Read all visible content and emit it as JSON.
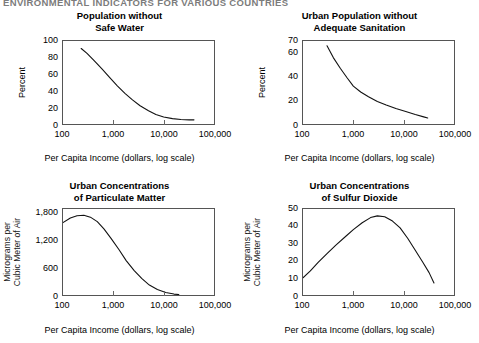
{
  "page_header": "ENVIRONMENTAL INDICATORS FOR VARIOUS COUNTRIES",
  "shared": {
    "xlabel": "Per Capita Income (dollars, log scale)",
    "xticks": [
      "100",
      "1,000",
      "10,000",
      "100,000"
    ]
  },
  "chart_data": [
    {
      "id": "population-without-safe-water",
      "type": "line",
      "title_line1": "Population without",
      "title_line2": "Safe Water",
      "xlabel": "Per Capita Income (dollars, log scale)",
      "ylabel": "Percent",
      "ylabel_line1": "Percent",
      "ylabel_line2": "",
      "xscale": "log",
      "xlim": [
        100,
        100000
      ],
      "xticks": [
        "100",
        "1,000",
        "10,000",
        "100,000"
      ],
      "xtickvalues": [
        100,
        1000,
        10000,
        100000
      ],
      "ylim": [
        0,
        100
      ],
      "yticks": [
        "0",
        "20",
        "40",
        "60",
        "80",
        "100"
      ],
      "ytickvalues": [
        0,
        20,
        40,
        60,
        80,
        100
      ],
      "grid": false,
      "legend": "none",
      "x": [
        230,
        300,
        420,
        600,
        850,
        1200,
        1700,
        2400,
        3400,
        5000,
        7000,
        10000,
        15000,
        22000,
        32000,
        40000
      ],
      "y": [
        91,
        85,
        76,
        66,
        56,
        46,
        37,
        29,
        22,
        16,
        11.5,
        8.5,
        6.5,
        5.5,
        5,
        5
      ]
    },
    {
      "id": "urban-population-without-adequate-sanitation",
      "type": "line",
      "title_line1": "Urban Population without",
      "title_line2": "Adequate Sanitation",
      "xlabel": "Per Capita Income (dollars, log scale)",
      "ylabel": "Percent",
      "ylabel_line1": "Percent",
      "ylabel_line2": "",
      "xscale": "log",
      "xlim": [
        100,
        100000
      ],
      "xticks": [
        "100",
        "1,000",
        "10,000",
        "100,000"
      ],
      "xtickvalues": [
        100,
        1000,
        10000,
        100000
      ],
      "ylim": [
        0,
        70
      ],
      "yticks": [
        "0",
        "20",
        "40",
        "60",
        "70"
      ],
      "ytickvalues": [
        0,
        20,
        40,
        60,
        70
      ],
      "grid": false,
      "legend": "none",
      "x": [
        300,
        400,
        550,
        750,
        1000,
        1400,
        2000,
        3000,
        4500,
        7000,
        11000,
        17000,
        25000,
        30000
      ],
      "y": [
        66,
        56,
        47,
        39,
        32,
        27,
        23,
        19,
        16,
        13,
        10.5,
        8,
        6,
        5
      ]
    },
    {
      "id": "urban-concentrations-of-particulate-matter",
      "type": "line",
      "title_line1": "Urban Concentrations",
      "title_line2": "of Particulate Matter",
      "xlabel": "Per Capita Income (dollars, log scale)",
      "ylabel": "Micrograms per Cubic Meter of Air",
      "ylabel_line1": "Micrograms per",
      "ylabel_line2": "Cubic Meter of Air",
      "xscale": "log",
      "xlim": [
        100,
        100000
      ],
      "xticks": [
        "100",
        "1,000",
        "10,000",
        "100,000"
      ],
      "xtickvalues": [
        100,
        1000,
        10000,
        100000
      ],
      "ylim": [
        0,
        1900
      ],
      "yticks": [
        "0",
        "600",
        "1,200",
        "1,800"
      ],
      "ytickvalues": [
        0,
        600,
        1200,
        1800
      ],
      "grid": false,
      "legend": "none",
      "x": [
        100,
        140,
        190,
        260,
        350,
        480,
        650,
        900,
        1300,
        1800,
        2600,
        3700,
        5200,
        7500,
        11000,
        16000,
        20000
      ],
      "y": [
        1600,
        1700,
        1750,
        1760,
        1720,
        1620,
        1460,
        1250,
        1000,
        760,
        540,
        360,
        220,
        120,
        55,
        20,
        10
      ]
    },
    {
      "id": "urban-concentrations-of-sulfur-dioxide",
      "type": "line",
      "title_line1": "Urban Concentrations",
      "title_line2": "of Sulfur Dioxide",
      "xlabel": "Per Capita Income (dollars, log scale)",
      "ylabel": "Micrograms per Cubic Meter of Air",
      "ylabel_line1": "Micrograms per",
      "ylabel_line2": "Cubic Meter of Air",
      "xscale": "log",
      "xlim": [
        100,
        100000
      ],
      "xticks": [
        "100",
        "1,000",
        "10,000",
        "100,000"
      ],
      "xtickvalues": [
        100,
        1000,
        10000,
        100000
      ],
      "ylim": [
        0,
        50
      ],
      "yticks": [
        "0",
        "10",
        "20",
        "30",
        "40",
        "50"
      ],
      "ytickvalues": [
        0,
        10,
        20,
        30,
        40,
        50
      ],
      "grid": false,
      "legend": "none",
      "x": [
        100,
        140,
        200,
        300,
        450,
        700,
        1000,
        1500,
        2200,
        3000,
        4200,
        6000,
        8500,
        12000,
        17000,
        24000,
        32000,
        40000
      ],
      "y": [
        10,
        14,
        19,
        24,
        29,
        34,
        38,
        42,
        45,
        46,
        45.5,
        43,
        39,
        33,
        26,
        19,
        13,
        7
      ]
    }
  ]
}
